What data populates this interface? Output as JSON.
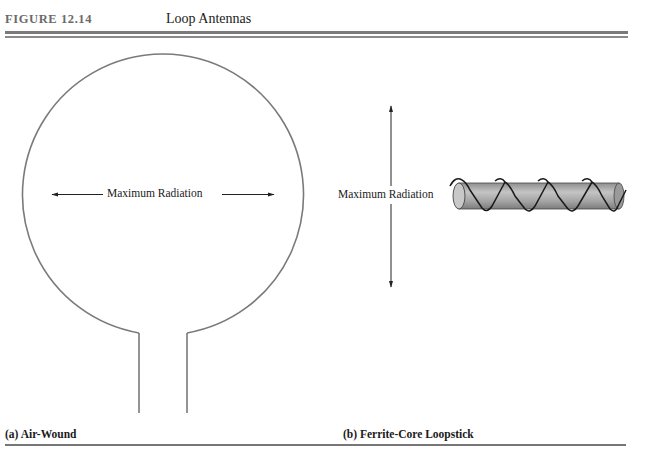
{
  "figure": {
    "label": "FIGURE 12.14",
    "title": "Loop Antennas"
  },
  "panels": [
    {
      "caption": "(a) Air-Wound",
      "annotation": "Maximum Radiation",
      "shape": "circular-loop-with-leads",
      "arrow_direction": "horizontal-bidirectional"
    },
    {
      "caption": "(b) Ferrite-Core Loopstick",
      "annotation": "Maximum Radiation",
      "shape": "ferrite-rod-with-coil",
      "arrow_direction": "vertical-bidirectional"
    }
  ],
  "colors": {
    "loop_stroke": "#7a7a7a",
    "rod_fill": "#a8a8a8",
    "coil": "#1a1a1a",
    "rule": "#7a7a7a"
  }
}
